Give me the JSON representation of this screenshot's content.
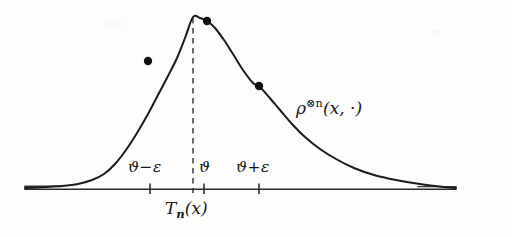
{
  "figure": {
    "kind": "statistics-density-diagram",
    "background_color": "#fdfdfc",
    "ink_color": "#16161a",
    "axis_color": "#2a2a2e",
    "curve_label": "ρ",
    "curve_label_superscript": "⊗n",
    "curve_label_argument": "(x, ·)",
    "center_label": "ϑ",
    "left_tick_label": "ϑ−ε",
    "right_tick_label": "ϑ+ε",
    "estimator_label_main": "T",
    "estimator_label_sub": "n",
    "estimator_label_arg": "(x)",
    "smudge_left": "˜˜˜",
    "smudge_right": "˜˜"
  },
  "chart_data": {
    "type": "line",
    "title": "",
    "subtitle": "",
    "xlabel": "",
    "ylabel": "",
    "grid": false,
    "legend": "none",
    "axis_range_px": {
      "x": [
        25,
        456
      ],
      "y": [
        17,
        190
      ]
    },
    "baseline_y_px": 189,
    "series": [
      {
        "name": "ρ⊗n(x, ·)",
        "description": "asymmetric bell-shaped density with heavy right tail",
        "x": [
          25,
          45,
          62,
          78,
          92,
          104,
          115,
          126,
          137,
          148,
          158,
          168,
          177,
          185,
          193,
          200,
          207,
          215,
          224,
          233,
          243,
          253,
          259,
          268,
          280,
          292,
          305,
          320,
          336,
          354,
          374,
          396,
          420,
          444,
          456
        ],
        "y": [
          188,
          187,
          186,
          184,
          180,
          174,
          164,
          150,
          133,
          114,
          95,
          76,
          58,
          38,
          17,
          18,
          21,
          28,
          40,
          54,
          70,
          83,
          86,
          96,
          110,
          124,
          137,
          149,
          159,
          168,
          175,
          180,
          184,
          187,
          188
        ]
      }
    ],
    "markers": [
      {
        "name": "left-flank-point",
        "x": 148,
        "y": 61,
        "radius": 4.2
      },
      {
        "name": "near-peak-point",
        "x": 207,
        "y": 21,
        "radius": 4.2
      },
      {
        "name": "right-flank-point",
        "x": 259,
        "y": 86,
        "radius": 4.2
      }
    ],
    "ticks": [
      {
        "name": "tick-theta-minus-eps",
        "x": 150,
        "label": "ϑ−ε"
      },
      {
        "name": "tick-theta",
        "x": 204,
        "label": "ϑ"
      },
      {
        "name": "tick-theta-plus-eps",
        "x": 259,
        "label": "ϑ+ε"
      }
    ],
    "vertical_dashed_line": {
      "name": "peak-guide-line",
      "x": 193,
      "y_top": 18,
      "y_bottom": 193
    },
    "annotations": [
      {
        "name": "density-label",
        "text": "ρ⊗n(x, ·)",
        "x": 300,
        "y": 108
      },
      {
        "name": "estimator-label",
        "text": "Tₙ(x)",
        "x": 196,
        "y": 211
      }
    ]
  }
}
